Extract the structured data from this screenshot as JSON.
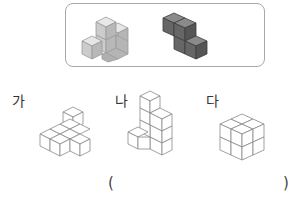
{
  "reference_box": {
    "pieces": [
      {
        "name": "light-piece",
        "color": "#cfcfcf"
      },
      {
        "name": "dark-piece",
        "color": "#6e6e6e"
      }
    ]
  },
  "options": [
    {
      "label": "가"
    },
    {
      "label": "나"
    },
    {
      "label": "다"
    }
  ],
  "answer": {
    "open": "(",
    "close": ")"
  }
}
